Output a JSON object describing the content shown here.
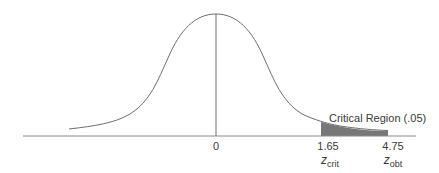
{
  "diagram": {
    "type": "normal-distribution-one-tailed-test",
    "colors": {
      "curve": "#6e6e6e",
      "axis": "#8a8a8a",
      "shade": "#777777",
      "text": "#3a3a3a"
    },
    "region_label": "Critical Region (.05)",
    "ticks": [
      {
        "value": "0",
        "sub_label": null
      },
      {
        "value": "1.65",
        "z": "z",
        "sub": "crit"
      },
      {
        "value": "4.75",
        "z": "z",
        "sub": "obt"
      }
    ]
  }
}
